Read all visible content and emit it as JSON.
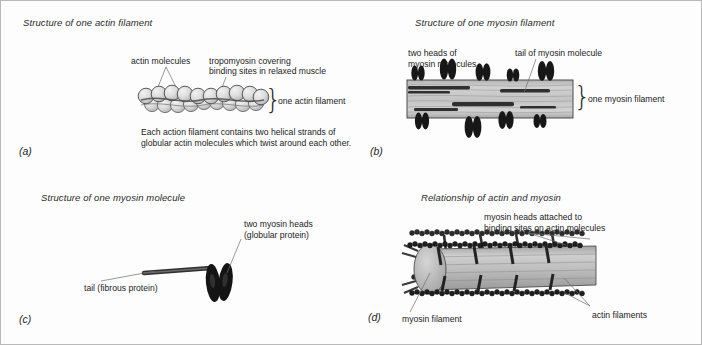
{
  "figure": {
    "type": "scientific-diagram",
    "panel_count": 4
  },
  "panels": [
    {
      "letter": "(a)",
      "title": "Structure of one actin filament",
      "labels": [
        "actin molecules",
        "tropomyosin covering",
        "binding sites in relaxed muscle",
        "one actin filament"
      ],
      "caption_line1": "Each action filament contains two helical strands of",
      "caption_line2": "globular actin molecules which twist around each other.",
      "brace": "}"
    },
    {
      "letter": "(b)",
      "title": "Structure of one myosin filament",
      "labels": [
        "two heads of",
        "myosin molecules",
        "tail of myosin molecule",
        "one myosin filament"
      ],
      "brace": "}"
    },
    {
      "letter": "(c)",
      "title": "Structure of one myosin molecule",
      "labels": [
        "two myosin heads",
        "(globular protein)",
        "tail (fibrous protein)"
      ]
    },
    {
      "letter": "(d)",
      "title": "Relationship of actin and myosin",
      "labels": [
        "myosin heads attached to",
        "binding sites on actin molecules",
        "myosin filament",
        "actin filaments"
      ]
    }
  ],
  "colors": {
    "background": "#fdfdfd",
    "border": "#b9b9b9",
    "ink": "#232323",
    "bead_fill": "#d8d8d8",
    "bead_stroke": "#4a4a4a",
    "myosin_head": "#1a1a1a",
    "filament_grey": "#a9a9a9",
    "filament_dark": "#4f4f4f",
    "leader_line": "#6d6d6d"
  }
}
